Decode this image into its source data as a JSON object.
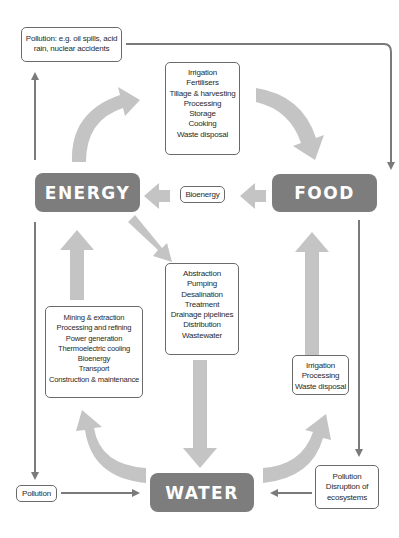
{
  "nodes": {
    "energy": "ENERGY",
    "food": "FOOD",
    "water": "WATER"
  },
  "boxes": {
    "pollution_top": [
      "Pollution: e.g. oil spills, acid",
      "rain, nuclear accidents"
    ],
    "energy_for_food": [
      "Irrigation",
      "Fertilisers",
      "Tillage & harvesting",
      "Processing",
      "Storage",
      "Cooking",
      "Waste disposal"
    ],
    "bioenergy": [
      "Bioenergy"
    ],
    "energy_for_water": [
      "Abstraction",
      "Pumping",
      "Desalination",
      "Treatment",
      "Drainage pipelines",
      "Distribution",
      "Wastewater"
    ],
    "water_for_energy": [
      "Mining & extraction",
      "Processing and refining",
      "Power generation",
      "Thermoelectric cooling",
      "Bioenergy",
      "Transport",
      "Construction & maintenance"
    ],
    "water_for_food": [
      "Irrigation",
      "Processing",
      "Waste disposal"
    ],
    "pollution_left": [
      "Pollution"
    ],
    "pollution_right": [
      "Pollution",
      "Disruption of",
      "ecosystems"
    ]
  },
  "colors": {
    "node_fill": "#7d7d7d",
    "thick_arrow": "#c4c4c4",
    "thin_arrow": "#7a7a7a",
    "box_border": "#6a6a6a"
  }
}
